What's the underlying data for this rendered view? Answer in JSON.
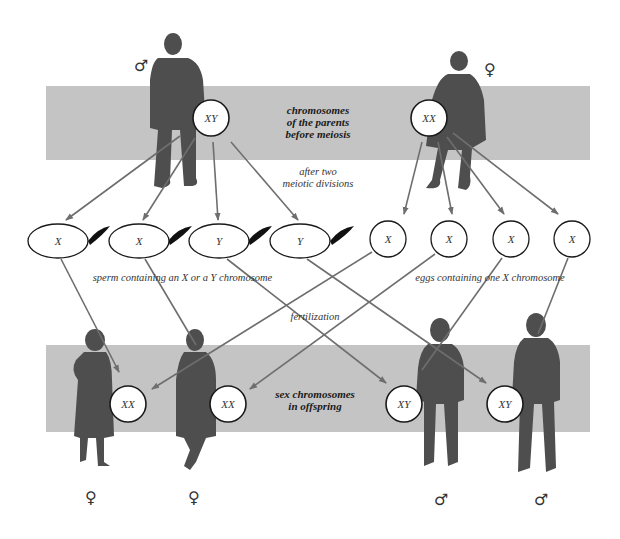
{
  "diagram": {
    "title_parents": [
      "chromosomes",
      "of the parents",
      "before meiosis"
    ],
    "label_meiosis": [
      "after two",
      "meiotic divisions"
    ],
    "label_sperm": "sperm containing an X or a Y chromosome",
    "label_eggs": "eggs containing one X chromosome",
    "label_fertilization": "fertilization",
    "title_offspring": [
      "sex chromosomes",
      "in offspring"
    ],
    "parents": [
      {
        "role": "father",
        "symbol": "♂",
        "genotype": "XY"
      },
      {
        "role": "mother",
        "symbol": "♀",
        "genotype": "XX"
      }
    ],
    "sperm": [
      "X",
      "X",
      "Y",
      "Y"
    ],
    "eggs": [
      "X",
      "X",
      "X",
      "X"
    ],
    "offspring": [
      {
        "genotype": "XX",
        "symbol": "♀"
      },
      {
        "genotype": "XX",
        "symbol": "♀"
      },
      {
        "genotype": "XY",
        "symbol": "♂"
      },
      {
        "genotype": "XY",
        "symbol": "♂"
      }
    ],
    "colors": {
      "band": "#c4c4c4",
      "silhouette": "#4e4e4e",
      "arrow": "#6e6e6e",
      "outline": "#1a1a1a"
    }
  }
}
